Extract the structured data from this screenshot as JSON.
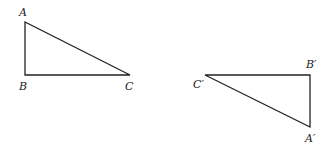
{
  "diagram": {
    "triangles": [
      {
        "id": "ABC",
        "vertices": [
          {
            "label": "A",
            "x": 25,
            "y": 22,
            "lx": 19,
            "ly": 16
          },
          {
            "label": "B",
            "x": 25,
            "y": 75,
            "lx": 19,
            "ly": 90
          },
          {
            "label": "C",
            "x": 130,
            "y": 75,
            "lx": 125,
            "ly": 90
          }
        ],
        "right_angle_at": "B"
      },
      {
        "id": "A'B'C'",
        "vertices": [
          {
            "label": "A′",
            "x": 310,
            "y": 127,
            "lx": 305,
            "ly": 142
          },
          {
            "label": "B′",
            "x": 310,
            "y": 75,
            "lx": 306,
            "ly": 68
          },
          {
            "label": "C′",
            "x": 205,
            "y": 75,
            "lx": 193,
            "ly": 88
          }
        ],
        "right_angle_at": "B′"
      }
    ],
    "colors": {
      "stroke": "#222222",
      "background": "#ffffff"
    }
  }
}
